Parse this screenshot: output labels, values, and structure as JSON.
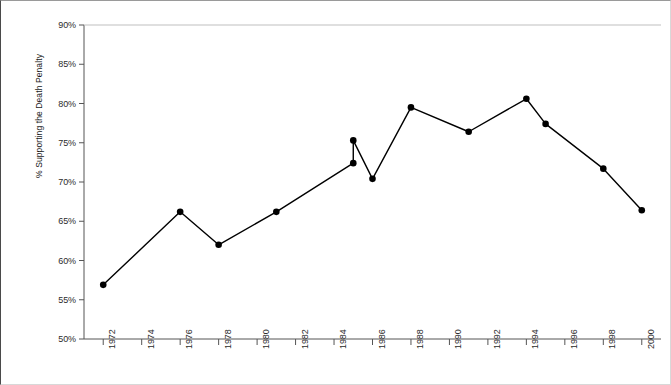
{
  "chart_data": {
    "type": "line",
    "title": "",
    "xlabel": "",
    "ylabel": "% Supporting the Death Penalty",
    "ylim": [
      50,
      90
    ],
    "ytick_values": [
      50,
      55,
      60,
      65,
      70,
      75,
      80,
      85,
      90
    ],
    "ytick_labels": [
      "50%",
      "55%",
      "60%",
      "65%",
      "70%",
      "75%",
      "80%",
      "85%",
      "90%"
    ],
    "xlim": [
      1971,
      2001
    ],
    "xtick_values": [
      1972,
      1974,
      1976,
      1978,
      1980,
      1982,
      1984,
      1986,
      1988,
      1990,
      1992,
      1994,
      1996,
      1998,
      2000
    ],
    "xtick_labels": [
      "1972",
      "1974",
      "1976",
      "1978",
      "1980",
      "1982",
      "1984",
      "1986",
      "1988",
      "1990",
      "1992",
      "1994",
      "1996",
      "1998",
      "2000"
    ],
    "grid": false,
    "legend": "none",
    "marker": "filled-circle",
    "line_color": "#000000",
    "marker_color": "#000000",
    "series": [
      {
        "name": "% Supporting the Death Penalty",
        "points": [
          {
            "x": 1972,
            "y": 56.9
          },
          {
            "x": 1976,
            "y": 66.2
          },
          {
            "x": 1978,
            "y": 62.0
          },
          {
            "x": 1981,
            "y": 66.2
          },
          {
            "x": 1985,
            "y": 72.4
          },
          {
            "x": 1985,
            "y": 75.3
          },
          {
            "x": 1986,
            "y": 70.4
          },
          {
            "x": 1988,
            "y": 79.5
          },
          {
            "x": 1991,
            "y": 76.4
          },
          {
            "x": 1994,
            "y": 80.6
          },
          {
            "x": 1995,
            "y": 77.4
          },
          {
            "x": 1998,
            "y": 71.7
          },
          {
            "x": 2000,
            "y": 66.4
          }
        ]
      }
    ]
  },
  "axes": {
    "y_axis_name": "y-axis",
    "x_axis_name": "x-axis"
  }
}
